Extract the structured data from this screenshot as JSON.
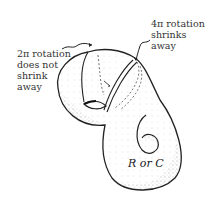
{
  "figure": {
    "annotations": {
      "left": [
        "2π rotation",
        "does not",
        "shrink",
        "away"
      ],
      "right": [
        "4π rotation",
        "shrinks",
        "away"
      ],
      "center": "ℛ or 𝒞"
    },
    "center_label_text": "R or C",
    "colors": {
      "ink": "#222222",
      "stipple": "#555555",
      "background": "#ffffff"
    }
  }
}
